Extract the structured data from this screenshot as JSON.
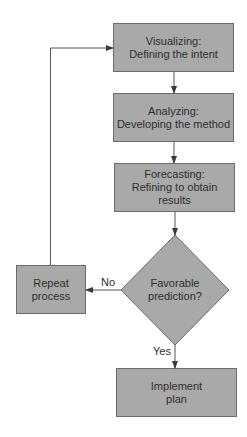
{
  "diagram": {
    "type": "flowchart",
    "colors": {
      "node_fill": "#a9a9a9",
      "node_stroke": "#6b6b6b",
      "line": "#555555",
      "text": "#2e2e2e",
      "background": "#ffffff"
    },
    "nodes": [
      {
        "id": "visualizing",
        "shape": "rect",
        "label": "Visualizing:\nDefining the intent"
      },
      {
        "id": "analyzing",
        "shape": "rect",
        "label": "Analyzing:\nDeveloping the method"
      },
      {
        "id": "forecasting",
        "shape": "rect",
        "label": "Forecasting:\nRefining to obtain\nresults"
      },
      {
        "id": "decision",
        "shape": "diamond",
        "label": "Favorable\nprediction?"
      },
      {
        "id": "repeat",
        "shape": "rect",
        "label": "Repeat\nprocess"
      },
      {
        "id": "implement",
        "shape": "rect",
        "label": "Implement\nplan"
      }
    ],
    "edges": [
      {
        "from": "visualizing",
        "to": "analyzing",
        "label": ""
      },
      {
        "from": "analyzing",
        "to": "forecasting",
        "label": ""
      },
      {
        "from": "forecasting",
        "to": "decision",
        "label": ""
      },
      {
        "from": "decision",
        "to": "repeat",
        "label": "No"
      },
      {
        "from": "decision",
        "to": "implement",
        "label": "Yes"
      },
      {
        "from": "repeat",
        "to": "visualizing",
        "label": ""
      }
    ],
    "edge_labels": {
      "no": "No",
      "yes": "Yes"
    }
  }
}
